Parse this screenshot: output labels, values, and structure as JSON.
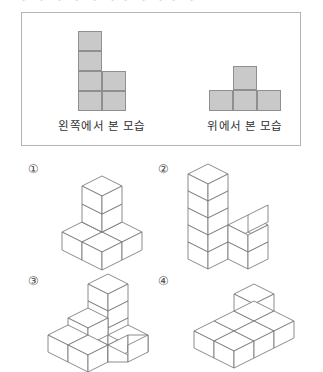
{
  "page": {
    "top_clipped_text": "・ ・ ・ ・ ・      ・・ ・ ・・    ・",
    "background_color": "#ffffff",
    "cell_fill_color": "#c9c9c9",
    "cell_border_color": "#8f8f8f",
    "line_color": "#6f6f6f"
  },
  "views_panel": {
    "border_color": "#b4b4b4",
    "left_view": {
      "caption": "왼쪽에서 본 모습",
      "grid_cols": 2,
      "grid_rows": 4,
      "filled_cells": [
        {
          "col": 0,
          "row": 0
        },
        {
          "col": 0,
          "row": 1
        },
        {
          "col": 0,
          "row": 2
        },
        {
          "col": 0,
          "row": 3
        },
        {
          "col": 1,
          "row": 2
        },
        {
          "col": 1,
          "row": 3
        }
      ]
    },
    "top_view": {
      "caption": "위에서 본 모습",
      "grid_cols": 3,
      "grid_rows": 2,
      "filled_cells": [
        {
          "col": 1,
          "row": 0
        },
        {
          "col": 0,
          "row": 1
        },
        {
          "col": 1,
          "row": 1
        },
        {
          "col": 2,
          "row": 1
        }
      ]
    }
  },
  "options": [
    {
      "marker": "①",
      "name": "option-1",
      "description": "L-shaped base of four cubes with a two-cube stack rising at the inner corner"
    },
    {
      "marker": "②",
      "name": "option-2",
      "description": "Tall five-cube column with two cubes extending to the right at the bottom"
    },
    {
      "marker": "③",
      "name": "option-3",
      "description": "Stepped staircase form with a three-cube column at the back"
    },
    {
      "marker": "④",
      "name": "option-4",
      "description": "Wide flat slab of cubes with a single cube on top at the back"
    }
  ]
}
